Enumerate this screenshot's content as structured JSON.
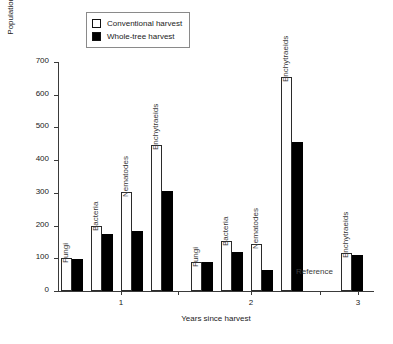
{
  "legend": {
    "items": [
      {
        "label": "Conventional harvest",
        "swatch": "open",
        "color": "#ffffff"
      },
      {
        "label": "Whole-tree harvest",
        "swatch": "filled",
        "color": "#000000"
      }
    ]
  },
  "axes": {
    "ylabel": "Population relative to reference (%)",
    "xlabel": "Years since harvest",
    "yticks": [
      "0",
      "100",
      "200",
      "300",
      "400",
      "500",
      "600",
      "700"
    ],
    "xticks": [
      "1",
      "2",
      "3"
    ]
  },
  "annotations": [
    {
      "text": "Reference"
    }
  ],
  "chart_data": {
    "type": "bar",
    "title": "",
    "xlabel": "Years since harvest",
    "ylabel": "Population relative to reference (%)",
    "ylim": [
      0,
      700
    ],
    "ytick_values": [
      0,
      100,
      200,
      300,
      400,
      500,
      600,
      700
    ],
    "grid": false,
    "legend_position": "top-left",
    "groups": [
      "1",
      "2",
      "3"
    ],
    "categories": [
      "Fungi",
      "Bacteria",
      "Nematodes",
      "Enchytraeids"
    ],
    "series": [
      {
        "name": "Conventional harvest",
        "color": "#ffffff"
      },
      {
        "name": "Whole-tree harvest",
        "color": "#000000"
      }
    ],
    "bars": [
      {
        "group": "1",
        "category": "Fungi",
        "conventional": 100,
        "whole_tree": 98
      },
      {
        "group": "1",
        "category": "Bacteria",
        "conventional": 200,
        "whole_tree": 175
      },
      {
        "group": "1",
        "category": "Nematodes",
        "conventional": 302,
        "whole_tree": 182
      },
      {
        "group": "1",
        "category": "Enchytraeids",
        "conventional": 445,
        "whole_tree": 305
      },
      {
        "group": "2",
        "category": "Fungi",
        "conventional": 90,
        "whole_tree": 90
      },
      {
        "group": "2",
        "category": "Bacteria",
        "conventional": 152,
        "whole_tree": 120
      },
      {
        "group": "2",
        "category": "Nematodes",
        "conventional": 145,
        "whole_tree": 65
      },
      {
        "group": "2",
        "category": "Enchytraeids",
        "conventional": 653,
        "whole_tree": 455
      },
      {
        "group": "3",
        "category": "Enchytraeids",
        "conventional": 115,
        "whole_tree": 110
      }
    ],
    "notes": [
      "Reference"
    ]
  },
  "layout": {
    "plot": {
      "left": 58,
      "top": 62,
      "width": 316,
      "height": 229
    },
    "ymax": 700,
    "bar_width": 11,
    "pair_gap": 0,
    "cluster_gap": 4,
    "bars_layout": [
      {
        "x": 3,
        "label_offset": -2
      },
      {
        "x": 33,
        "label_offset": -2
      },
      {
        "x": 63,
        "label_offset": -2
      },
      {
        "x": 93,
        "label_offset": -2
      },
      {
        "x": 133,
        "label_offset": -2
      },
      {
        "x": 163,
        "label_offset": -2
      },
      {
        "x": 193,
        "label_offset": -2
      },
      {
        "x": 223,
        "label_offset": -2
      },
      {
        "x": 283,
        "label_offset": -2
      }
    ],
    "xtick_x": [
      63,
      193,
      300
    ]
  }
}
